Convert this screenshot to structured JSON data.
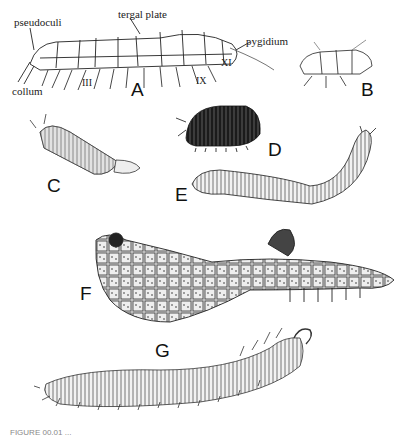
{
  "figure": {
    "panels": [
      {
        "letter": "A",
        "description": "millipede lateral view with labeled anatomy"
      },
      {
        "letter": "B",
        "description": "small millipede lateral view"
      },
      {
        "letter": "C",
        "description": "bristly millipede with tail tufts"
      },
      {
        "letter": "D",
        "description": "pill millipede, dark domed body"
      },
      {
        "letter": "E",
        "description": "long cylindrical millipede"
      },
      {
        "letter": "F",
        "description": "coiled flat-backed millipede"
      },
      {
        "letter": "G",
        "description": "long many-legged millipede"
      }
    ],
    "annotations": {
      "pseudoculi": "pseudoculi",
      "tergal_plate": "tergal plate",
      "pygidium": "pygidium",
      "collum": "collum",
      "seg_III": "III",
      "seg_IX": "IX",
      "seg_XI": "XI"
    },
    "caption": "FIGURE 00.01  ..."
  },
  "colors": {
    "ink": "#1a1a1a",
    "paper": "#ffffff"
  }
}
